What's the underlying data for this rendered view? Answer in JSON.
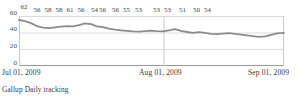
{
  "chart_data": {
    "type": "line",
    "title": "",
    "subtitle": "",
    "xlabel": "",
    "ylabel": "",
    "source_note": "Gallup Daily tracking",
    "ylim": [
      0,
      60
    ],
    "yticks": [
      0,
      20,
      40,
      60
    ],
    "ytick_labels": [
      "0",
      "20",
      "40",
      "60"
    ],
    "xticks": [
      "Jul 01, 2009",
      "Aug 01, 2009",
      "Sep 01, 2009"
    ],
    "grid": "horizontal-and-vertical",
    "legend": "none",
    "line_color": "#8c8c8c",
    "grid_color": "#d9d9d9",
    "axis_color": "#9a9a9a",
    "label_color": "#434343",
    "categories": [
      "Jul 01, 2009",
      "Jul 04, 2009",
      "Jul 07, 2009",
      "Jul 10, 2009",
      "Jul 13, 2009",
      "Jul 16, 2009",
      "Jul 19, 2009",
      "Jul 22, 2009",
      "Jul 25, 2009",
      "Jul 28, 2009",
      "Jul 31, 2009",
      "Aug 03, 2009",
      "Aug 06, 2009",
      "Aug 09, 2009",
      "Aug 12, 2009",
      "Aug 15, 2009",
      "Aug 18, 2009",
      "Aug 21, 2009",
      "Aug 24, 2009",
      "Aug 27, 2009",
      "Aug 30, 2009",
      "Sep 01, 2009"
    ],
    "values": [
      62,
      60,
      56,
      57,
      58,
      58,
      58,
      61,
      59,
      56,
      55,
      54,
      56,
      55,
      56,
      55,
      53,
      53,
      53,
      51,
      50,
      54
    ],
    "point_labels": [
      {
        "value": 62,
        "x_pct": 1.5
      },
      {
        "value": 56,
        "x_pct": 14.5
      },
      {
        "value": 58,
        "x_pct": 25.5
      },
      {
        "value": 58,
        "x_pct": 36.5
      },
      {
        "value": 61,
        "x_pct": 47.5
      },
      {
        "value": 56,
        "x_pct": 58.5
      },
      {
        "value": 54,
        "x_pct": 72.0
      },
      {
        "value": 56,
        "x_pct": 80.0
      },
      {
        "value": 56,
        "x_pct": 93.0
      },
      {
        "value": 55,
        "x_pct": 104.0
      },
      {
        "value": 53,
        "x_pct": 116.0
      },
      {
        "value": 53,
        "x_pct": 134.0
      },
      {
        "value": 53,
        "x_pct": 145.0
      },
      {
        "value": 51,
        "x_pct": 160.0
      },
      {
        "value": 50,
        "x_pct": 174.0
      },
      {
        "value": 54,
        "x_pct": 185.0
      }
    ],
    "series_path": "0,4 6,5.2 12,7.1 18,10.2 24,11.6 30,12.2 36,11.4 42,10.6 48,10.2 54,10.4 60,9.1 66,7.4 72,8.2 78,10.4 84,11.2 90,12.6 96,13.6 102,14.3 108,14.9 114,15.4 120,15.6 126,15.2 132,14.6 138,15.1 144,15.4 150,14.3 156,13.2 162,14.8 168,16.0 174,16.8 180,16.2 186,16.9 192,17.8 198,18.2 204,17.6 210,17.2 216,17.8 222,18.6 228,19.4 234,20.2 240,20.8 246,20.4 252,18.9 258,17.4 265,16.8"
  },
  "axis": {
    "x_tick_positions_px": [
      2,
      163,
      270
    ]
  },
  "top_crop_text": ""
}
